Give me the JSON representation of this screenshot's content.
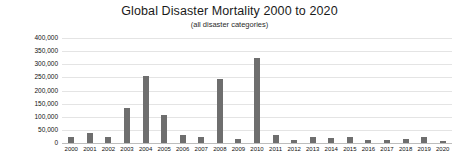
{
  "chart_data": {
    "type": "bar",
    "title": "Global Disaster Mortality 2000 to 2020",
    "subtitle": "(all disaster categories)",
    "xlabel": "",
    "ylabel": "",
    "grid": true,
    "legend": null,
    "ylim": [
      0,
      400000
    ],
    "ytick_step": 50000,
    "ytick_labels": [
      "400,000",
      "350,000",
      "300,000",
      "250,000",
      "200,000",
      "150,000",
      "100,000",
      "50,000",
      "0"
    ],
    "ytick_values": [
      400000,
      350000,
      300000,
      250000,
      200000,
      150000,
      100000,
      50000,
      0
    ],
    "categories": [
      "2000",
      "2001",
      "2002",
      "2003",
      "2004",
      "2005",
      "2006",
      "2007",
      "2008",
      "2009",
      "2010",
      "2011",
      "2012",
      "2013",
      "2014",
      "2015",
      "2016",
      "2017",
      "2018",
      "2019",
      "2020"
    ],
    "values": [
      22000,
      38000,
      22000,
      135000,
      255000,
      105000,
      32000,
      22000,
      245000,
      16000,
      325000,
      32000,
      12000,
      22000,
      20000,
      24000,
      10000,
      10000,
      14000,
      24000,
      9000
    ],
    "bar_color": "#6e6e6e",
    "background_color": "#ffffff",
    "grid_color": "#e4e4e4"
  }
}
